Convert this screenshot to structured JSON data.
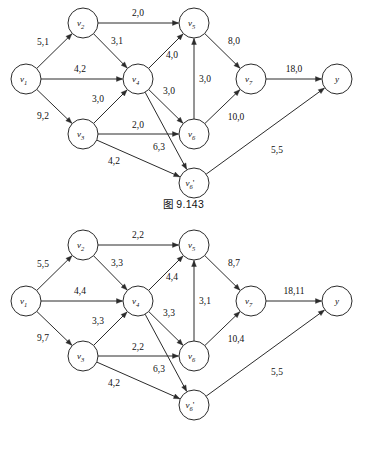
{
  "page": {
    "background": "#ffffff",
    "ink": "#2b2b2b"
  },
  "figures": [
    {
      "id": "figure-1",
      "caption": "图 9.143",
      "nodes": [
        {
          "key": "v1",
          "label": "v",
          "sub": "1",
          "prime": "",
          "cx": 26,
          "cy": 79,
          "r": 15
        },
        {
          "key": "v2",
          "label": "v",
          "sub": "2",
          "prime": "",
          "cx": 83,
          "cy": 23,
          "r": 15
        },
        {
          "key": "v3",
          "label": "v",
          "sub": "3",
          "prime": "",
          "cx": 83,
          "cy": 134,
          "r": 15
        },
        {
          "key": "v4",
          "label": "v",
          "sub": "4",
          "prime": "",
          "cx": 138,
          "cy": 79,
          "r": 15
        },
        {
          "key": "v5",
          "label": "v",
          "sub": "5",
          "prime": "",
          "cx": 194,
          "cy": 23,
          "r": 15
        },
        {
          "key": "v6",
          "label": "v",
          "sub": "6",
          "prime": "",
          "cx": 194,
          "cy": 134,
          "r": 15
        },
        {
          "key": "v6p",
          "label": "v",
          "sub": "6",
          "prime": "'",
          "cx": 194,
          "cy": 183,
          "r": 15
        },
        {
          "key": "v7",
          "label": "v",
          "sub": "7",
          "prime": "",
          "cx": 251,
          "cy": 79,
          "r": 15
        },
        {
          "key": "y",
          "label": "y",
          "sub": "",
          "prime": "",
          "cx": 337,
          "cy": 79,
          "r": 15
        }
      ],
      "edges": [
        {
          "name": "edge-v1-v2",
          "from": "v1",
          "to": "v2",
          "label": "5,1",
          "lx": 43,
          "ly": 42
        },
        {
          "name": "edge-v1-v4",
          "from": "v1",
          "to": "v4",
          "label": "4,2",
          "lx": 80,
          "ly": 69
        },
        {
          "name": "edge-v1-v3",
          "from": "v1",
          "to": "v3",
          "label": "9,2",
          "lx": 43,
          "ly": 116
        },
        {
          "name": "edge-v2-v5",
          "from": "v2",
          "to": "v5",
          "label": "2,0",
          "lx": 138,
          "ly": 13
        },
        {
          "name": "edge-v2-v4",
          "from": "v2",
          "to": "v4",
          "label": "3,1",
          "lx": 117,
          "ly": 41
        },
        {
          "name": "edge-v3-v4",
          "from": "v3",
          "to": "v4",
          "label": "3,0",
          "lx": 98,
          "ly": 99
        },
        {
          "name": "edge-v3-v6",
          "from": "v3",
          "to": "v6",
          "label": "2,0",
          "lx": 138,
          "ly": 125
        },
        {
          "name": "edge-v3-v6p",
          "from": "v3",
          "to": "v6p",
          "label": "4,2",
          "lx": 114,
          "ly": 161
        },
        {
          "name": "edge-v4-v5",
          "from": "v4",
          "to": "v5",
          "label": "4,0",
          "lx": 172,
          "ly": 55
        },
        {
          "name": "edge-v4-v6",
          "from": "v4",
          "to": "v6",
          "label": "3,0",
          "lx": 169,
          "ly": 91
        },
        {
          "name": "edge-v4-v6p",
          "from": "v4",
          "to": "v6p",
          "label": "6,3",
          "lx": 159,
          "ly": 147
        },
        {
          "name": "edge-v6-v5",
          "from": "v6",
          "to": "v5",
          "label": "3,0",
          "lx": 205,
          "ly": 79
        },
        {
          "name": "edge-v5-v7",
          "from": "v5",
          "to": "v7",
          "label": "8,0",
          "lx": 234,
          "ly": 41
        },
        {
          "name": "edge-v6-v7",
          "from": "v6",
          "to": "v7",
          "label": "10,0",
          "lx": 236,
          "ly": 117
        },
        {
          "name": "edge-v7-y",
          "from": "v7",
          "to": "y",
          "label": "18,0",
          "lx": 294,
          "ly": 69
        },
        {
          "name": "edge-v6p-y",
          "from": "v6p",
          "to": "y",
          "label": "5,5",
          "lx": 277,
          "ly": 150
        }
      ]
    },
    {
      "id": "figure-2",
      "caption": "图 9.144",
      "nodes": [
        {
          "key": "v1",
          "label": "v",
          "sub": "1",
          "prime": "",
          "cx": 26,
          "cy": 79,
          "r": 15
        },
        {
          "key": "v2",
          "label": "v",
          "sub": "2",
          "prime": "",
          "cx": 83,
          "cy": 23,
          "r": 15
        },
        {
          "key": "v3",
          "label": "v",
          "sub": "3",
          "prime": "",
          "cx": 83,
          "cy": 134,
          "r": 15
        },
        {
          "key": "v4",
          "label": "v",
          "sub": "4",
          "prime": "",
          "cx": 138,
          "cy": 79,
          "r": 15
        },
        {
          "key": "v5",
          "label": "v",
          "sub": "5",
          "prime": "",
          "cx": 194,
          "cy": 23,
          "r": 15
        },
        {
          "key": "v6",
          "label": "v",
          "sub": "6",
          "prime": "",
          "cx": 194,
          "cy": 134,
          "r": 15
        },
        {
          "key": "v6p",
          "label": "v",
          "sub": "6",
          "prime": "'",
          "cx": 194,
          "cy": 183,
          "r": 15
        },
        {
          "key": "v7",
          "label": "v",
          "sub": "7",
          "prime": "",
          "cx": 251,
          "cy": 79,
          "r": 15
        },
        {
          "key": "y",
          "label": "y",
          "sub": "",
          "prime": "",
          "cx": 337,
          "cy": 79,
          "r": 15
        }
      ],
      "edges": [
        {
          "name": "edge-v1-v2",
          "from": "v1",
          "to": "v2",
          "label": "5,5",
          "lx": 43,
          "ly": 42
        },
        {
          "name": "edge-v1-v4",
          "from": "v1",
          "to": "v4",
          "label": "4,4",
          "lx": 80,
          "ly": 69
        },
        {
          "name": "edge-v1-v3",
          "from": "v1",
          "to": "v3",
          "label": "9,7",
          "lx": 43,
          "ly": 116
        },
        {
          "name": "edge-v2-v5",
          "from": "v2",
          "to": "v5",
          "label": "2,2",
          "lx": 138,
          "ly": 13
        },
        {
          "name": "edge-v2-v4",
          "from": "v2",
          "to": "v4",
          "label": "3,3",
          "lx": 117,
          "ly": 41
        },
        {
          "name": "edge-v3-v4",
          "from": "v3",
          "to": "v4",
          "label": "3,3",
          "lx": 98,
          "ly": 99
        },
        {
          "name": "edge-v3-v6",
          "from": "v3",
          "to": "v6",
          "label": "2,2",
          "lx": 138,
          "ly": 125
        },
        {
          "name": "edge-v3-v6p",
          "from": "v3",
          "to": "v6p",
          "label": "4,2",
          "lx": 114,
          "ly": 161
        },
        {
          "name": "edge-v4-v5",
          "from": "v4",
          "to": "v5",
          "label": "4,4",
          "lx": 172,
          "ly": 55
        },
        {
          "name": "edge-v4-v6",
          "from": "v4",
          "to": "v6",
          "label": "3,3",
          "lx": 169,
          "ly": 91
        },
        {
          "name": "edge-v4-v6p",
          "from": "v4",
          "to": "v6p",
          "label": "6,3",
          "lx": 159,
          "ly": 147
        },
        {
          "name": "edge-v6-v5",
          "from": "v6",
          "to": "v5",
          "label": "3,1",
          "lx": 205,
          "ly": 79
        },
        {
          "name": "edge-v5-v7",
          "from": "v5",
          "to": "v7",
          "label": "8,7",
          "lx": 234,
          "ly": 41
        },
        {
          "name": "edge-v6-v7",
          "from": "v6",
          "to": "v7",
          "label": "10,4",
          "lx": 236,
          "ly": 117
        },
        {
          "name": "edge-v7-y",
          "from": "v7",
          "to": "y",
          "label": "18,11",
          "lx": 294,
          "ly": 69
        },
        {
          "name": "edge-v6p-y",
          "from": "v6p",
          "to": "y",
          "label": "5,5",
          "lx": 277,
          "ly": 150
        }
      ]
    }
  ]
}
